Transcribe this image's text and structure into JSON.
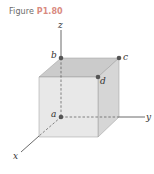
{
  "figure": {
    "caption_prefix": "Figure",
    "caption_number": "P1.80"
  },
  "axes": {
    "x_label": "x",
    "y_label": "y",
    "z_label": "z"
  },
  "points": [
    {
      "label": "a",
      "role": "origin"
    },
    {
      "label": "b",
      "role": "top of z-axis edge"
    },
    {
      "label": "c",
      "role": "top back corner"
    },
    {
      "label": "d",
      "role": "top front corner"
    }
  ],
  "colors": {
    "caption_number": "#d98a80",
    "cube_top": "#c9c9c9",
    "cube_front": "#e6e6e6",
    "cube_side": "#d4d4d4",
    "point": "#555555"
  }
}
